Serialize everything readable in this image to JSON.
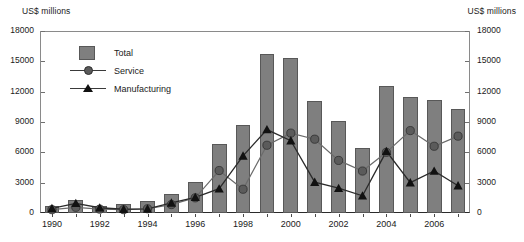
{
  "chart_data": {
    "type": "bar",
    "title": "",
    "subtitle": "",
    "xlabel": "",
    "ylabel": "US$ millions",
    "ylabel_right": "US$ millions",
    "ylim": [
      0,
      18000
    ],
    "yticks": [
      0,
      3000,
      6000,
      9000,
      12000,
      15000,
      18000
    ],
    "ytick_labels": [
      "0",
      "3000",
      "6000",
      "9000",
      "12000",
      "15000",
      "18000"
    ],
    "grid": false,
    "legend_position": "upper-left-inside",
    "categories": [
      "1990",
      "1991",
      "1992",
      "1993",
      "1994",
      "1995",
      "1996",
      "1997",
      "1998",
      "1999",
      "2000",
      "2001",
      "2002",
      "2003",
      "2004",
      "2005",
      "2006",
      "2007"
    ],
    "xtick_labels": [
      "1990",
      "1992",
      "1994",
      "1996",
      "1998",
      "2000",
      "2002",
      "2004",
      "2006"
    ],
    "series": [
      {
        "name": "Total",
        "type": "bar",
        "values": [
          700,
          1250,
          700,
          900,
          1150,
          1850,
          3100,
          6850,
          8700,
          15750,
          15350,
          11050,
          9100,
          6400,
          12550,
          11450,
          11150,
          10300
        ]
      },
      {
        "name": "Service",
        "type": "line",
        "marker": "circle",
        "values": [
          330,
          560,
          380,
          330,
          420,
          830,
          1500,
          4200,
          2350,
          6700,
          7900,
          7300,
          5200,
          4150,
          6000,
          8150,
          6600,
          7600
        ]
      },
      {
        "name": "Manufacturing",
        "type": "line",
        "marker": "triangle",
        "values": [
          450,
          960,
          520,
          370,
          410,
          1000,
          1550,
          2400,
          5650,
          8250,
          7150,
          3050,
          2450,
          1700,
          6100,
          3000,
          4150,
          2700
        ]
      }
    ],
    "colors": {
      "bar_fill": "#7f7f7f",
      "bar_edge": "#585858",
      "service_line": "#6b6b6b",
      "service_marker": "#5b5b5b",
      "manufacturing_line": "#2b2b2b",
      "manufacturing_marker": "#111111",
      "axis": "#2b2b2b",
      "text": "#1a1a1a"
    }
  },
  "legend": {
    "items": [
      {
        "label": "Total",
        "icon": "bar-swatch-icon"
      },
      {
        "label": "Service",
        "icon": "circle-marker-icon"
      },
      {
        "label": "Manufacturing",
        "icon": "triangle-marker-icon"
      }
    ]
  }
}
